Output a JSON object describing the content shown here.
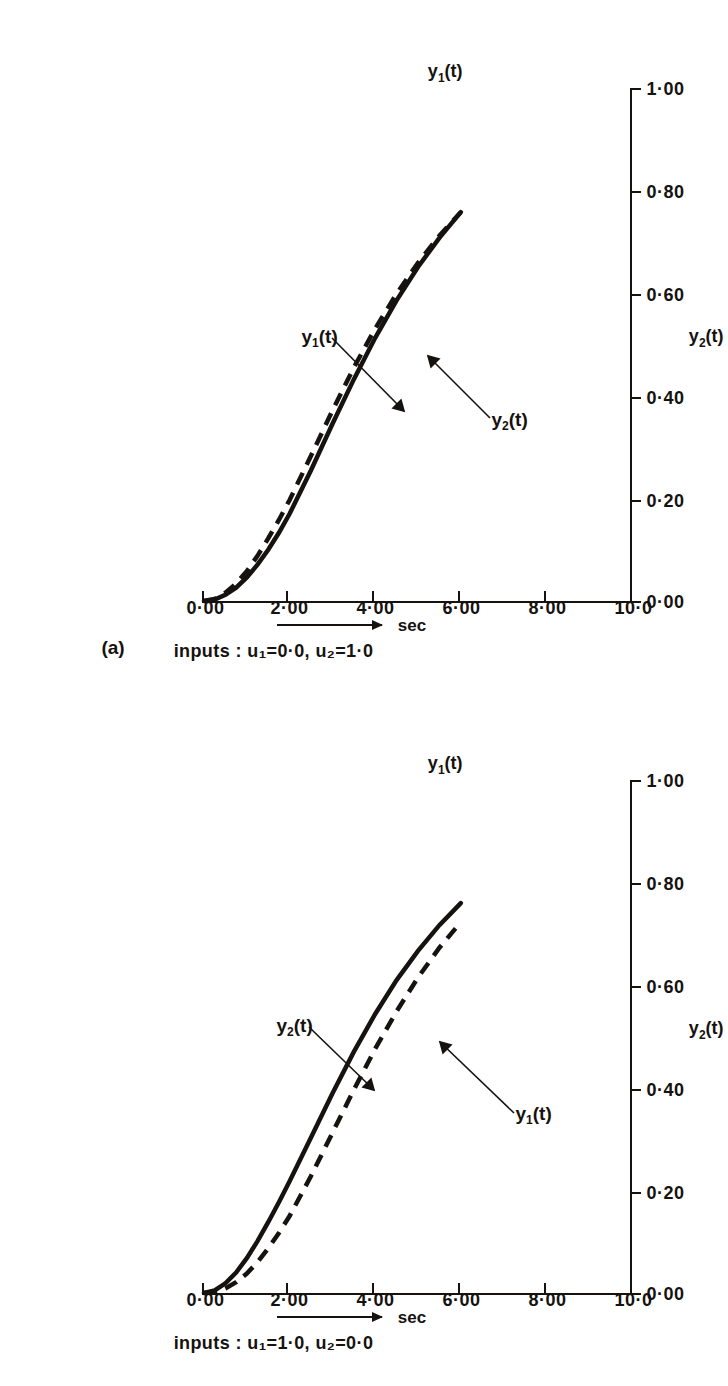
{
  "figure": {
    "orientation": "rotated-90",
    "panels": [
      {
        "tag": "(a)",
        "time_axis_label": "sec",
        "inputs_text": "inputs : u₁=0·0, u₂=1·0",
        "inputs_prefix": "inputs :",
        "left_axis_name": "y",
        "left_axis_sub": "1",
        "left_axis_suffix": "(t)",
        "right_axis_name": "y",
        "right_axis_sub": "2",
        "right_axis_suffix": "(t)",
        "curve_labels": [
          {
            "name": "y",
            "sub": "1",
            "suffix": "(t)"
          },
          {
            "name": "y",
            "sub": "2",
            "suffix": "(t)"
          }
        ]
      },
      {
        "tag": "",
        "time_axis_label": "sec",
        "inputs_text": "inputs : u₁=1·0, u₂=0·0",
        "inputs_prefix": "inputs :",
        "left_axis_name": "y",
        "left_axis_sub": "1",
        "left_axis_suffix": "(t)",
        "right_axis_name": "y",
        "right_axis_sub": "2",
        "right_axis_suffix": "(t)",
        "curve_labels": [
          {
            "name": "y",
            "sub": "1",
            "suffix": "(t)"
          },
          {
            "name": "y",
            "sub": "2",
            "suffix": "(t)"
          }
        ]
      }
    ]
  },
  "chart_data": [
    {
      "type": "line",
      "title": "(a)  step response, inputs u1=0.0, u2=1.0",
      "panel": "a",
      "xlabel": "sec",
      "ylabel": "y1(t) , y2(t)",
      "xlim": [
        0.0,
        10.0
      ],
      "ylim": [
        0.0,
        1.0
      ],
      "xticks": [
        "0·00",
        "2·00",
        "4·00",
        "6·00",
        "8·00",
        "10·0"
      ],
      "xtick_values": [
        0,
        2,
        4,
        6,
        8,
        10
      ],
      "yticks": [
        "0·00",
        "0·20",
        "0·40",
        "0·60",
        "0·80",
        "1·00"
      ],
      "ytick_values": [
        0.0,
        0.2,
        0.4,
        0.6,
        0.8,
        1.0
      ],
      "grid": false,
      "legend": "annotated-inline",
      "annotations": [
        "y1(t)",
        "y2(t)"
      ],
      "x": [
        0.0,
        0.25,
        0.5,
        0.75,
        1.0,
        1.25,
        1.5,
        1.75,
        2.0,
        2.5,
        3.0,
        3.5,
        4.0,
        4.5,
        5.0,
        5.5,
        6.0
      ],
      "series": [
        {
          "name": "y1(t)",
          "style": "solid",
          "color": "#15120f",
          "values": [
            0.0,
            0.003,
            0.012,
            0.026,
            0.046,
            0.071,
            0.1,
            0.133,
            0.17,
            0.255,
            0.345,
            0.432,
            0.513,
            0.586,
            0.651,
            0.708,
            0.758
          ]
        },
        {
          "name": "y2(t)",
          "style": "dashed",
          "color": "#15120f",
          "values": [
            0.0,
            0.004,
            0.016,
            0.034,
            0.058,
            0.088,
            0.122,
            0.158,
            0.197,
            0.283,
            0.371,
            0.455,
            0.531,
            0.599,
            0.659,
            0.712,
            0.758
          ]
        }
      ]
    },
    {
      "type": "line",
      "title": "(b)  step response, inputs u1=1.0, u2=0.0",
      "panel": "b",
      "xlabel": "sec",
      "ylabel": "y1(t) , y2(t)",
      "xlim": [
        0.0,
        10.0
      ],
      "ylim": [
        0.0,
        1.0
      ],
      "xticks": [
        "0·00",
        "2·00",
        "4·00",
        "6·00",
        "8·00",
        "10·0"
      ],
      "xtick_values": [
        0,
        2,
        4,
        6,
        8,
        10
      ],
      "yticks": [
        "0·00",
        "0·20",
        "0·40",
        "0·60",
        "0·80",
        "1·00"
      ],
      "ytick_values": [
        0.0,
        0.2,
        0.4,
        0.6,
        0.8,
        1.0
      ],
      "grid": false,
      "legend": "annotated-inline",
      "annotations": [
        "y1(t)",
        "y2(t)"
      ],
      "x": [
        0.0,
        0.25,
        0.5,
        0.75,
        1.0,
        1.25,
        1.5,
        1.75,
        2.0,
        2.5,
        3.0,
        3.5,
        4.0,
        4.5,
        5.0,
        5.5,
        6.0
      ],
      "series": [
        {
          "name": "y1(t)",
          "style": "solid",
          "color": "#15120f",
          "values": [
            0.0,
            0.005,
            0.019,
            0.04,
            0.068,
            0.101,
            0.138,
            0.177,
            0.218,
            0.303,
            0.389,
            0.47,
            0.544,
            0.61,
            0.667,
            0.717,
            0.76
          ]
        },
        {
          "name": "y2(t)",
          "style": "dashed",
          "color": "#15120f",
          "values": [
            0.0,
            0.002,
            0.009,
            0.021,
            0.038,
            0.06,
            0.087,
            0.117,
            0.15,
            0.228,
            0.312,
            0.396,
            0.476,
            0.549,
            0.615,
            0.673,
            0.723
          ]
        }
      ]
    }
  ]
}
